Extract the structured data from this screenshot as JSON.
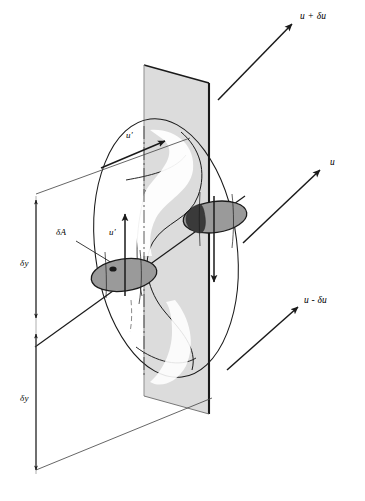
{
  "figure": {
    "caption": "",
    "background_color": "#ffffff",
    "line_color": "#1a1a1a",
    "plane_fill": "#dcdcdc",
    "ellipse_fill": "#9a9a9a",
    "blob_fill": "#3a3a3a"
  },
  "velocity_labels": [
    {
      "id": "u-plus-du",
      "text": "u + δu",
      "x": 300,
      "y": 18
    },
    {
      "id": "u",
      "text": "u",
      "x": 330,
      "y": 164
    },
    {
      "id": "u-minus-du",
      "text": "u - δu",
      "x": 306,
      "y": 302
    }
  ],
  "dimension_labels": [
    {
      "id": "delta-y-upper",
      "text": "δy",
      "x": 24,
      "y": 265
    },
    {
      "id": "delta-y-lower",
      "text": "δy",
      "x": 24,
      "y": 400
    }
  ],
  "area_label": {
    "id": "delta-A",
    "text": "δA",
    "x": 58,
    "y": 234
  },
  "fluctuation_labels": [
    {
      "id": "u-prime-diagonal",
      "text": "u′",
      "x": 127,
      "y": 137
    },
    {
      "id": "u-prime-vertical",
      "text": "u′",
      "x": 110,
      "y": 234
    }
  ]
}
